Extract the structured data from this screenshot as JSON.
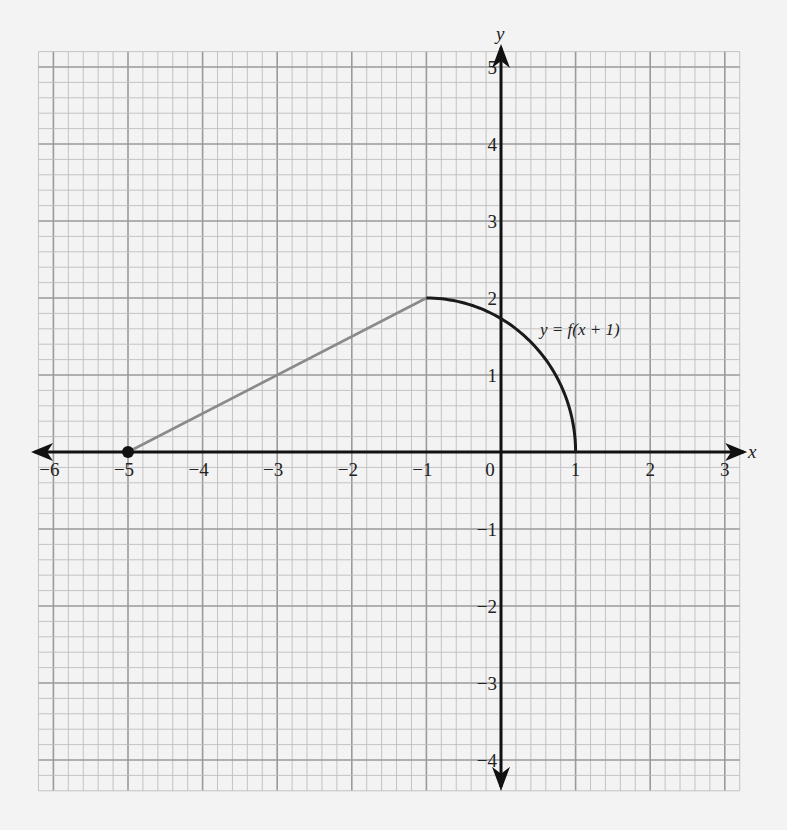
{
  "chart_data": {
    "type": "line",
    "title": "",
    "xlabel": "x",
    "ylabel": "y",
    "xlim": [
      -6,
      3
    ],
    "ylim": [
      -4,
      5
    ],
    "grid": {
      "on": true,
      "major_step": 1,
      "minor_step": 0.2
    },
    "x_ticks": [
      "-6",
      "-5",
      "-4",
      "-3",
      "-2",
      "-1",
      "0",
      "1",
      "2",
      "3"
    ],
    "y_ticks": [
      "-4",
      "-3",
      "-2",
      "-1",
      "1",
      "2",
      "3",
      "4",
      "5"
    ],
    "series": [
      {
        "name": "segment",
        "kind": "line",
        "color": "#8a8a8a",
        "points": [
          [
            -5,
            0
          ],
          [
            -1,
            2
          ]
        ]
      },
      {
        "name": "quarter-ellipse",
        "kind": "arc",
        "color": "#1a1a1a",
        "description": "quarter arc from (-1, 2) down to (1, 0)",
        "points": [
          [
            -1,
            2
          ],
          [
            0,
            1.73
          ],
          [
            0.5,
            1.32
          ],
          [
            0.8,
            0.87
          ],
          [
            1,
            0
          ]
        ]
      }
    ],
    "annotations": [
      {
        "text": "y = f(x + 1)",
        "x": 0.15,
        "y": 1.55
      }
    ],
    "markers": [
      {
        "type": "closed-dot",
        "x": -5,
        "y": 0
      }
    ]
  },
  "labels": {
    "x_axis": "x",
    "y_axis": "y",
    "curve": "y = f(x + 1)",
    "origin": "0"
  },
  "colors": {
    "background": "#f3f3f3",
    "grid_major": "#9a9a9a",
    "grid_minor": "#bdbdbd",
    "axis": "#111111",
    "segment": "#8a8a8a",
    "curve": "#1a1a1a"
  }
}
